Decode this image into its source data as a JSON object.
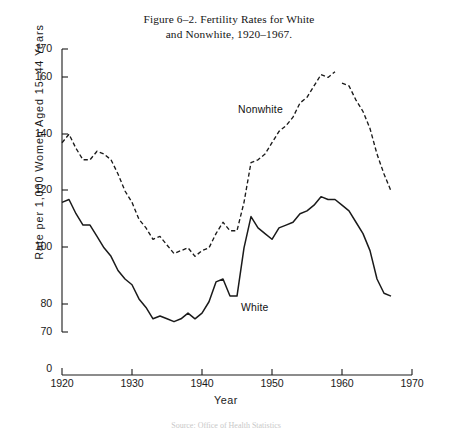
{
  "figure": {
    "title_line1": "Figure 6–2.   Fertility Rates for White",
    "title_line2": "and Nonwhite, 1920–1967.",
    "source_note": "Source: Office of Health Statistics"
  },
  "axes": {
    "ylabel": "Rate per 1,000 Women Aged 15–44 Years",
    "xlabel": "Year",
    "ytick_labels": [
      "170",
      "160",
      "140",
      "120",
      "100",
      "80",
      "70",
      "0"
    ],
    "xtick_labels": [
      "1920",
      "1930",
      "1940",
      "1950",
      "1960",
      "1970"
    ]
  },
  "legend": {
    "nonwhite": "Nonwhite",
    "white": "White"
  },
  "colors": {
    "ink": "#1a1a1a",
    "nonwhite_line": "#1a1a1a",
    "white_line": "#1a1a1a",
    "background": "#ffffff"
  },
  "chart_data": {
    "type": "line",
    "title": "Figure 6–2. Fertility Rates for White and Nonwhite, 1920–1967.",
    "xlabel": "Year",
    "ylabel": "Rate per 1,000 Women Aged 15–44 Years",
    "xlim": [
      1920,
      1970
    ],
    "ylim": [
      70,
      170
    ],
    "y_axis_break_below": 70,
    "ytick_values": [
      170,
      160,
      140,
      120,
      100,
      80,
      70,
      0
    ],
    "xtick_values": [
      1920,
      1930,
      1940,
      1950,
      1960,
      1970
    ],
    "grid": false,
    "legend_position": "inline-annotation",
    "x": [
      1920,
      1921,
      1922,
      1923,
      1924,
      1925,
      1926,
      1927,
      1928,
      1929,
      1930,
      1931,
      1932,
      1933,
      1934,
      1935,
      1936,
      1937,
      1938,
      1939,
      1940,
      1941,
      1942,
      1943,
      1944,
      1945,
      1946,
      1947,
      1948,
      1949,
      1950,
      1951,
      1952,
      1953,
      1954,
      1955,
      1956,
      1957,
      1958,
      1959,
      1960,
      1961,
      1962,
      1963,
      1964,
      1965,
      1966,
      1967
    ],
    "series": [
      {
        "name": "Nonwhite",
        "style": "dashed",
        "has_break_after": 1959,
        "values": [
          137,
          140,
          135,
          131,
          131,
          134,
          133,
          131,
          126,
          120,
          116,
          110,
          107,
          103,
          104,
          101,
          98,
          99,
          100,
          97,
          99,
          100,
          105,
          109,
          106,
          106,
          116,
          130,
          131,
          133,
          137,
          141,
          143,
          146,
          151,
          153,
          157,
          161,
          160,
          162,
          158,
          157,
          152,
          148,
          142,
          133,
          126,
          120
        ]
      },
      {
        "name": "White",
        "style": "solid",
        "values": [
          116,
          117,
          112,
          108,
          108,
          104,
          100,
          97,
          92,
          89,
          87,
          82,
          79,
          75,
          76,
          75,
          74,
          75,
          77,
          75,
          77,
          81,
          88,
          89,
          83,
          83,
          100,
          111,
          107,
          105,
          103,
          107,
          108,
          109,
          112,
          113,
          115,
          118,
          117,
          117,
          115,
          113,
          109,
          105,
          99,
          89,
          84,
          83
        ]
      }
    ]
  },
  "geometry": {
    "plot_left_px": 62,
    "plot_right_px": 412,
    "px_per_year": 7,
    "y170_px": 49,
    "px_per_unit": 2.84,
    "axis_baseline_px": 375
  }
}
